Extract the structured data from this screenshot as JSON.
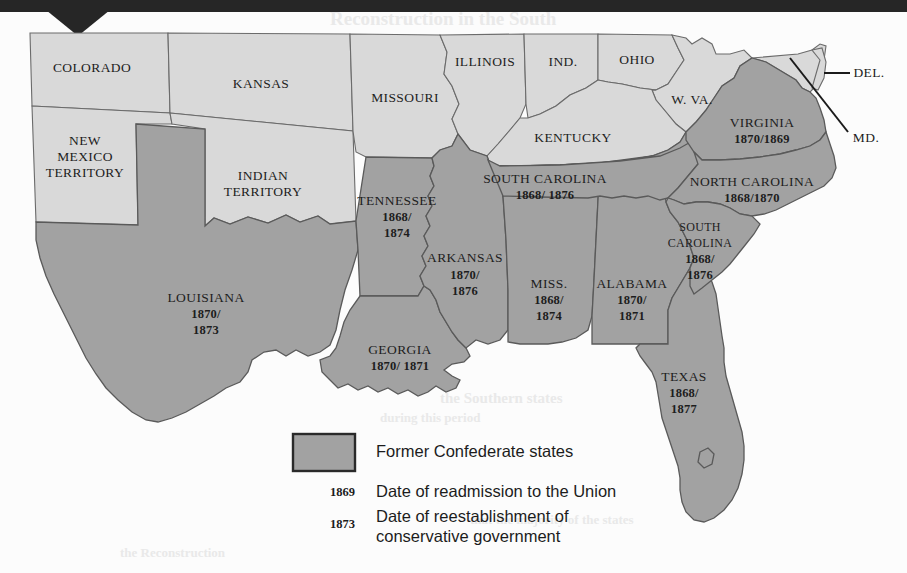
{
  "map": {
    "title_present": false,
    "colors": {
      "confederate_fill": "#a2a2a2",
      "union_fill": "#d9d9d9",
      "water_fill": "#fcfcfc",
      "border_stroke": "#5d5d5d",
      "outline_stroke": "#4a4a4a",
      "label_text": "#1d1d1d",
      "page_background": "#fcfcfc",
      "top_band": "#262626"
    },
    "states": [
      {
        "id": "colorado",
        "name": "COLORADO",
        "confederate": false,
        "dates": null,
        "label_x": 92,
        "label_y": 69
      },
      {
        "id": "kansas",
        "name": "KANSAS",
        "confederate": false,
        "dates": null,
        "label_x": 261,
        "label_y": 85
      },
      {
        "id": "missouri",
        "name": "MISSOURI",
        "confederate": false,
        "dates": null,
        "label_x": 405,
        "label_y": 99
      },
      {
        "id": "illinois",
        "name": "ILLINOIS",
        "confederate": false,
        "dates": null,
        "label_x": 485,
        "label_y": 63
      },
      {
        "id": "indiana",
        "name": "IND.",
        "confederate": false,
        "dates": null,
        "label_x": 563,
        "label_y": 63
      },
      {
        "id": "ohio",
        "name": "OHIO",
        "confederate": false,
        "dates": null,
        "label_x": 637,
        "label_y": 61
      },
      {
        "id": "west-virginia",
        "name": "W. VA.",
        "confederate": false,
        "dates": null,
        "label_x": 692,
        "label_y": 101
      },
      {
        "id": "kentucky",
        "name": "KENTUCKY",
        "confederate": false,
        "dates": null,
        "label_x": 573,
        "label_y": 139
      },
      {
        "id": "new-mexico",
        "name": "NEW\nMEXICO\nTERRITORY",
        "confederate": false,
        "dates": null,
        "label_x": 85,
        "label_y": 157
      },
      {
        "id": "indian-terr",
        "name": "INDIAN\nTERRITORY",
        "confederate": false,
        "dates": null,
        "label_x": 263,
        "label_y": 185
      },
      {
        "id": "delaware",
        "name": "DEL.",
        "confederate": false,
        "dates": null,
        "label_x": 869,
        "label_y": 74
      },
      {
        "id": "maryland",
        "name": "MD.",
        "confederate": false,
        "dates": null,
        "label_x": 866,
        "label_y": 139
      },
      {
        "id": "virginia",
        "name": "VIRGINIA",
        "confederate": true,
        "dates": "1870/1869",
        "label_x": 762,
        "label_y": 124
      },
      {
        "id": "north-carolina",
        "name": "NORTH CAROLINA",
        "confederate": true,
        "dates": "1868/1870",
        "label_x": 752,
        "label_y": 183
      },
      {
        "id": "south-carolina",
        "name": "SOUTH\nCAROLINA",
        "confederate": true,
        "dates": "1868/\n1876",
        "label_x": 700,
        "label_y": 231
      },
      {
        "id": "tennessee",
        "name": "TENNESSEE",
        "confederate": true,
        "dates": "1866/1869",
        "label_x": 545,
        "label_y": 182
      },
      {
        "id": "arkansas",
        "name": "ARKANSAS",
        "confederate": true,
        "dates": "1868/\n1874",
        "label_x": 397,
        "label_y": 205
      },
      {
        "id": "mississippi",
        "name": "MISS.",
        "confederate": true,
        "dates": "1870/\n1876",
        "label_x": 465,
        "label_y": 263
      },
      {
        "id": "alabama",
        "name": "ALABAMA",
        "confederate": true,
        "dates": "1868/\n1874",
        "label_x": 549,
        "label_y": 288
      },
      {
        "id": "georgia",
        "name": "GEORGIA",
        "confederate": true,
        "dates": "1870/\n1871",
        "label_x": 632,
        "label_y": 288
      },
      {
        "id": "louisiana",
        "name": "LOUISIANA",
        "confederate": true,
        "dates": "1868/1877",
        "label_x": 400,
        "label_y": 352
      },
      {
        "id": "texas",
        "name": "TEXAS",
        "confederate": true,
        "dates": "1870/\n1873",
        "label_x": 206,
        "label_y": 301
      },
      {
        "id": "florida",
        "name": "FLA.",
        "confederate": true,
        "dates": "1868/\n1877",
        "label_x": 684,
        "label_y": 380
      }
    ],
    "leader_lines": [
      {
        "id": "delaware-leader",
        "x1": 824,
        "y1": 73,
        "x2": 850,
        "y2": 73
      },
      {
        "id": "maryland-leader",
        "x1": 792,
        "y1": 60,
        "x2": 846,
        "y2": 130
      }
    ]
  },
  "legend": {
    "swatch": {
      "label": "Former Confederate states",
      "fill": "#a2a2a2",
      "stroke": "#2a2a2a"
    },
    "entries": [
      {
        "key": "1869",
        "label": "Date of readmission to the Union"
      },
      {
        "key": "1873",
        "label": "Date of reestablishment of\nconservative government"
      }
    ]
  },
  "bleed_through": [
    {
      "text": "Reconstruction in the South",
      "x": 330,
      "y": 18,
      "size": 19
    },
    {
      "text": "the Southern states",
      "x": 440,
      "y": 398,
      "size": 15
    },
    {
      "text": "during this period",
      "x": 380,
      "y": 418,
      "size": 13
    },
    {
      "text": "that the majority of the states",
      "x": 470,
      "y": 520,
      "size": 13
    },
    {
      "text": "the Reconstruction",
      "x": 120,
      "y": 553,
      "size": 13
    }
  ]
}
